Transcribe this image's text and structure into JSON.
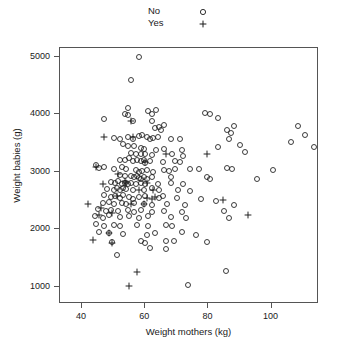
{
  "chart_data": {
    "type": "scatter",
    "title": "",
    "xlabel": "Weight mothers (kg)",
    "ylabel": "Weight babies (g)",
    "xlim": [
      33,
      115
    ],
    "ylim": [
      700,
      5150
    ],
    "xticks": [
      40,
      60,
      80,
      100
    ],
    "yticks": [
      1000,
      2000,
      3000,
      4000,
      5000
    ],
    "grid": false,
    "legend": {
      "position": "top-center",
      "entries": [
        {
          "name": "No",
          "marker": "circle"
        },
        {
          "name": "Yes",
          "marker": "plus"
        }
      ]
    },
    "series": [
      {
        "name": "No",
        "marker": "circle",
        "points": [
          [
            58.0,
            5000
          ],
          [
            55.5,
            4600
          ],
          [
            54.5,
            4100
          ],
          [
            54.5,
            3980
          ],
          [
            61.0,
            4060
          ],
          [
            62.0,
            4010
          ],
          [
            63.5,
            4080
          ],
          [
            47.0,
            3920
          ],
          [
            53.5,
            4000
          ],
          [
            56.0,
            3880
          ],
          [
            62.0,
            3880
          ],
          [
            66.0,
            3820
          ],
          [
            79.0,
            4020
          ],
          [
            80.5,
            4000
          ],
          [
            83.0,
            3930
          ],
          [
            88.0,
            3790
          ],
          [
            63.0,
            3760
          ],
          [
            64.5,
            3770
          ],
          [
            65.0,
            3730
          ],
          [
            86.0,
            3720
          ],
          [
            87.0,
            3680
          ],
          [
            108.5,
            3800
          ],
          [
            110.5,
            3640
          ],
          [
            106.0,
            3520
          ],
          [
            113.5,
            3430
          ],
          [
            50.0,
            3580
          ],
          [
            52.0,
            3560
          ],
          [
            54.5,
            3600
          ],
          [
            56.0,
            3560
          ],
          [
            58.0,
            3620
          ],
          [
            59.0,
            3640
          ],
          [
            60.5,
            3600
          ],
          [
            61.5,
            3570
          ],
          [
            62.5,
            3580
          ],
          [
            64.0,
            3610
          ],
          [
            68.0,
            3570
          ],
          [
            71.0,
            3570
          ],
          [
            86.5,
            3560
          ],
          [
            90.0,
            3460
          ],
          [
            53.0,
            3480
          ],
          [
            54.5,
            3440
          ],
          [
            56.5,
            3440
          ],
          [
            58.5,
            3420
          ],
          [
            59.5,
            3400
          ],
          [
            63.5,
            3380
          ],
          [
            66.0,
            3400
          ],
          [
            71.5,
            3380
          ],
          [
            83.0,
            3430
          ],
          [
            55.5,
            3320
          ],
          [
            57.0,
            3300
          ],
          [
            58.5,
            3300
          ],
          [
            60.0,
            3300
          ],
          [
            62.0,
            3290
          ],
          [
            68.5,
            3300
          ],
          [
            72.0,
            3280
          ],
          [
            91.5,
            3340
          ],
          [
            52.0,
            3200
          ],
          [
            53.5,
            3210
          ],
          [
            55.0,
            3230
          ],
          [
            56.0,
            3190
          ],
          [
            57.5,
            3210
          ],
          [
            58.5,
            3180
          ],
          [
            59.5,
            3200
          ],
          [
            60.0,
            3150
          ],
          [
            61.5,
            3180
          ],
          [
            65.5,
            3160
          ],
          [
            69.5,
            3180
          ],
          [
            71.0,
            3160
          ],
          [
            44.5,
            3110
          ],
          [
            45.5,
            3060
          ],
          [
            47.0,
            3090
          ],
          [
            50.0,
            3050
          ],
          [
            52.5,
            3080
          ],
          [
            54.0,
            3040
          ],
          [
            57.0,
            3030
          ],
          [
            58.0,
            3000
          ],
          [
            59.0,
            3010
          ],
          [
            60.5,
            3030
          ],
          [
            62.5,
            3000
          ],
          [
            66.0,
            3030
          ],
          [
            67.5,
            3020
          ],
          [
            69.5,
            3050
          ],
          [
            74.0,
            3040
          ],
          [
            77.0,
            3040
          ],
          [
            86.0,
            3060
          ],
          [
            87.5,
            3040
          ],
          [
            100.5,
            3030
          ],
          [
            52.0,
            2940
          ],
          [
            53.5,
            2920
          ],
          [
            55.5,
            2930
          ],
          [
            56.5,
            2900
          ],
          [
            57.5,
            2930
          ],
          [
            58.0,
            2890
          ],
          [
            58.5,
            2870
          ],
          [
            59.5,
            2900
          ],
          [
            60.5,
            2880
          ],
          [
            62.0,
            2910
          ],
          [
            68.0,
            2900
          ],
          [
            79.5,
            2900
          ],
          [
            80.5,
            2870
          ],
          [
            95.5,
            2880
          ],
          [
            49.0,
            2820
          ],
          [
            50.5,
            2800
          ],
          [
            51.5,
            2830
          ],
          [
            52.5,
            2790
          ],
          [
            53.5,
            2810
          ],
          [
            54.5,
            2790
          ],
          [
            55.5,
            2810
          ],
          [
            57.0,
            2780
          ],
          [
            58.5,
            2800
          ],
          [
            60.0,
            2780
          ],
          [
            64.0,
            2790
          ],
          [
            68.0,
            2800
          ],
          [
            72.0,
            2790
          ],
          [
            48.0,
            2700
          ],
          [
            50.0,
            2690
          ],
          [
            51.0,
            2720
          ],
          [
            52.0,
            2680
          ],
          [
            53.0,
            2710
          ],
          [
            54.0,
            2700
          ],
          [
            56.0,
            2680
          ],
          [
            59.5,
            2690
          ],
          [
            62.0,
            2710
          ],
          [
            64.5,
            2680
          ],
          [
            70.5,
            2690
          ],
          [
            74.0,
            2660
          ],
          [
            47.0,
            2590
          ],
          [
            49.0,
            2560
          ],
          [
            50.5,
            2580
          ],
          [
            52.0,
            2550
          ],
          [
            53.0,
            2590
          ],
          [
            55.0,
            2560
          ],
          [
            56.0,
            2530
          ],
          [
            58.0,
            2560
          ],
          [
            60.0,
            2580
          ],
          [
            64.5,
            2550
          ],
          [
            65.5,
            2570
          ],
          [
            70.0,
            2550
          ],
          [
            77.5,
            2520
          ],
          [
            82.5,
            2490
          ],
          [
            46.5,
            2460
          ],
          [
            48.5,
            2470
          ],
          [
            50.0,
            2440
          ],
          [
            52.5,
            2450
          ],
          [
            54.0,
            2430
          ],
          [
            56.5,
            2450
          ],
          [
            59.5,
            2440
          ],
          [
            62.0,
            2420
          ],
          [
            67.0,
            2440
          ],
          [
            72.5,
            2420
          ],
          [
            88.0,
            2420
          ],
          [
            45.0,
            2350
          ],
          [
            47.5,
            2320
          ],
          [
            49.0,
            2340
          ],
          [
            51.5,
            2310
          ],
          [
            54.5,
            2330
          ],
          [
            56.5,
            2300
          ],
          [
            58.5,
            2330
          ],
          [
            62.0,
            2300
          ],
          [
            66.0,
            2320
          ],
          [
            71.5,
            2300
          ],
          [
            85.0,
            2320
          ],
          [
            44.0,
            2230
          ],
          [
            46.5,
            2200
          ],
          [
            48.5,
            2240
          ],
          [
            52.0,
            2220
          ],
          [
            55.0,
            2230
          ],
          [
            58.0,
            2200
          ],
          [
            61.0,
            2230
          ],
          [
            68.0,
            2210
          ],
          [
            73.0,
            2190
          ],
          [
            86.5,
            2200
          ],
          [
            44.5,
            2090
          ],
          [
            47.0,
            2060
          ],
          [
            50.0,
            2080
          ],
          [
            52.0,
            2050
          ],
          [
            57.5,
            2080
          ],
          [
            61.0,
            2060
          ],
          [
            66.5,
            2070
          ],
          [
            68.5,
            2050
          ],
          [
            45.5,
            1950
          ],
          [
            48.5,
            1930
          ],
          [
            53.0,
            1920
          ],
          [
            60.5,
            1900
          ],
          [
            63.0,
            1930
          ],
          [
            71.5,
            1950
          ],
          [
            76.0,
            1900
          ],
          [
            49.5,
            1780
          ],
          [
            58.5,
            1790
          ],
          [
            60.0,
            1760
          ],
          [
            66.5,
            1800
          ],
          [
            69.0,
            1790
          ],
          [
            79.5,
            1780
          ],
          [
            61.5,
            1680
          ],
          [
            66.5,
            1650
          ],
          [
            51.0,
            1560
          ],
          [
            85.5,
            1270
          ],
          [
            73.5,
            1030
          ]
        ]
      },
      {
        "name": "Yes",
        "marker": "plus",
        "points": [
          [
            55.5,
            3880
          ],
          [
            56.0,
            3600
          ],
          [
            47.0,
            3600
          ],
          [
            66.5,
            3310
          ],
          [
            79.5,
            3300
          ],
          [
            60.0,
            3160
          ],
          [
            44.5,
            3090
          ],
          [
            51.5,
            2960
          ],
          [
            53.5,
            2840
          ],
          [
            46.5,
            2790
          ],
          [
            54.0,
            2800
          ],
          [
            60.5,
            2810
          ],
          [
            62.5,
            2680
          ],
          [
            58.0,
            2690
          ],
          [
            51.0,
            2570
          ],
          [
            60.5,
            2540
          ],
          [
            63.0,
            2560
          ],
          [
            62.0,
            2530
          ],
          [
            84.5,
            2510
          ],
          [
            42.0,
            2430
          ],
          [
            55.5,
            2430
          ],
          [
            59.5,
            2430
          ],
          [
            46.0,
            2370
          ],
          [
            49.5,
            2290
          ],
          [
            45.5,
            2250
          ],
          [
            92.5,
            2250
          ],
          [
            48.5,
            1930
          ],
          [
            43.5,
            1810
          ],
          [
            49.5,
            1760
          ],
          [
            57.5,
            1260
          ],
          [
            55.0,
            1020
          ]
        ]
      }
    ]
  }
}
